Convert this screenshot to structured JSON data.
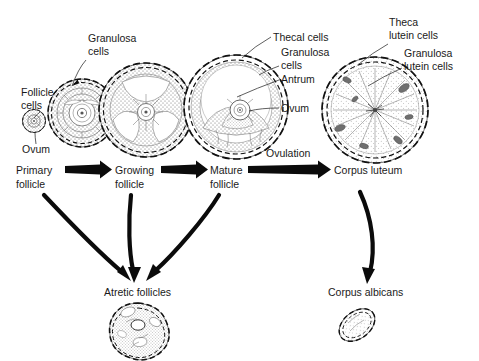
{
  "figure": {
    "background": "#ffffff",
    "ink": "#111111"
  },
  "stages": [
    {
      "id": "primary",
      "label_line1": "Primary",
      "label_line2": "follicle"
    },
    {
      "id": "growing",
      "label_line1": "Growing",
      "label_line2": "follicle"
    },
    {
      "id": "mature",
      "label_line1": "Mature",
      "label_line2": "follicle"
    },
    {
      "id": "corpus-luteum",
      "label_line1": "Corpus luteum",
      "label_line2": ""
    }
  ],
  "flow_arrows": [
    {
      "id": "primary-to-growing",
      "caption": ""
    },
    {
      "id": "growing-to-mature",
      "caption": ""
    },
    {
      "id": "mature-to-luteum",
      "caption": "Ovulation"
    }
  ],
  "outcomes": [
    {
      "id": "atretic",
      "label": "Atretic follicles"
    },
    {
      "id": "corpus-albicans",
      "label": "Corpus albicans"
    }
  ],
  "callouts": [
    {
      "id": "follicle-cells",
      "line1": "Follicle",
      "line2": "cells",
      "target": "primordial-follicle"
    },
    {
      "id": "ovum-primordial",
      "line1": "Ovum",
      "line2": "",
      "target": "primordial-follicle"
    },
    {
      "id": "granulosa-cells",
      "line1": "Granulosa",
      "line2": "cells",
      "target": "growing-follicle"
    },
    {
      "id": "thecal-cells",
      "line1": "Thecal cells",
      "line2": "",
      "target": "mature-follicle"
    },
    {
      "id": "granulosa-cells-mature",
      "line1": "Granulosa",
      "line2": "cells",
      "target": "mature-follicle"
    },
    {
      "id": "antrum",
      "line1": "Antrum",
      "line2": "",
      "target": "mature-follicle"
    },
    {
      "id": "ovum-mature",
      "line1": "Ovum",
      "line2": "",
      "target": "mature-follicle"
    },
    {
      "id": "theca-lutein-cells",
      "line1": "Theca",
      "line2": "lutein cells",
      "target": "corpus-luteum"
    },
    {
      "id": "granulosa-lutein-cells",
      "line1": "Granulosa",
      "line2": "lutein cells",
      "target": "corpus-luteum"
    }
  ],
  "atresia_arrows": [
    {
      "id": "primary-to-atretic"
    },
    {
      "id": "growing-to-atretic"
    },
    {
      "id": "mature-to-atretic"
    }
  ],
  "luteum_arrow": {
    "id": "luteum-to-albicans"
  }
}
